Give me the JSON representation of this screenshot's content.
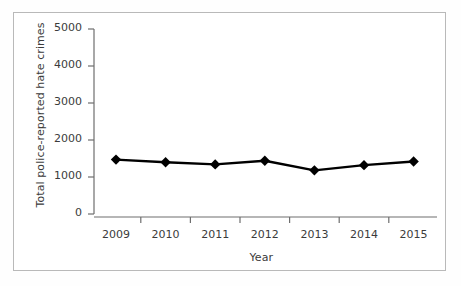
{
  "chart_data": {
    "type": "line",
    "title": "",
    "subtitle": "",
    "xlabel": "Year",
    "ylabel": "Total police-reported hate crimes",
    "categories": [
      "2009",
      "2010",
      "2011",
      "2012",
      "2013",
      "2014",
      "2015"
    ],
    "x": [
      2009,
      2010,
      2011,
      2012,
      2013,
      2014,
      2015
    ],
    "values": [
      1470,
      1400,
      1340,
      1440,
      1180,
      1320,
      1420
    ],
    "series": [
      {
        "name": "Total police-reported hate crimes",
        "values": [
          1470,
          1400,
          1340,
          1440,
          1180,
          1320,
          1420
        ],
        "marker": "diamond",
        "marker_color": "#000000",
        "line_color": "#000000"
      }
    ],
    "ylim": [
      0,
      5000
    ],
    "yticks": [
      0,
      1000,
      2000,
      3000,
      4000,
      5000
    ],
    "ytick_labels": [
      "0",
      "1000",
      "2000",
      "3000",
      "4000",
      "5000"
    ],
    "xtick_labels": [
      "2009",
      "2010",
      "2011",
      "2012",
      "2013",
      "2014",
      "2015"
    ],
    "grid": false,
    "legend": "none",
    "legend_position": "none",
    "axis_color": "#6e6e6e",
    "text_color": "#3b3b3b",
    "background_color": "#ffffff",
    "frame_color": "#b9b9b9"
  }
}
